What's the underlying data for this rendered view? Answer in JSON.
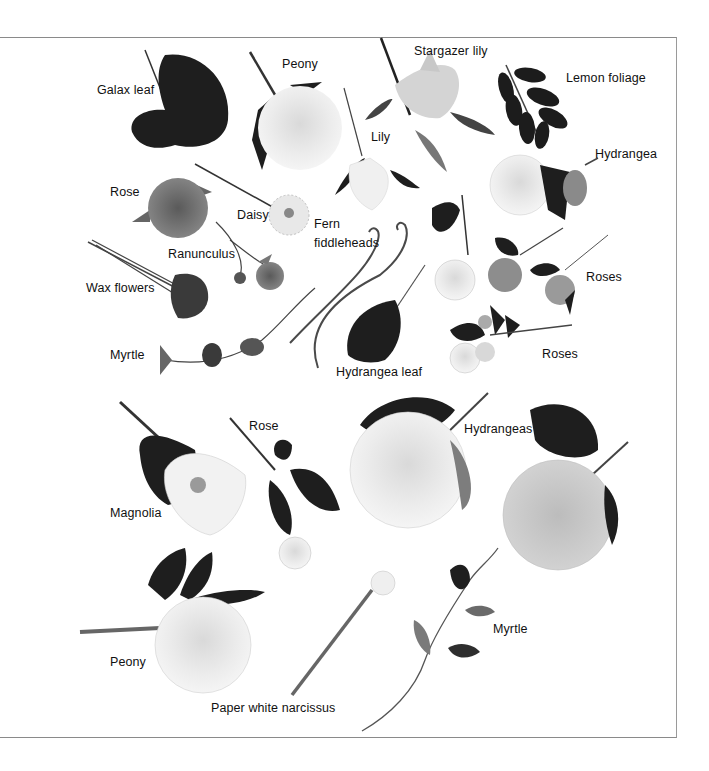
{
  "figure": {
    "title": "",
    "style": "grayscale botanical photo plate",
    "labels": [
      {
        "id": "galax-leaf",
        "text": "Galax leaf",
        "x": 97,
        "y": 81
      },
      {
        "id": "peony-top",
        "text": "Peony",
        "x": 282,
        "y": 55
      },
      {
        "id": "stargazer-lily",
        "text": "Stargazer lily",
        "x": 414,
        "y": 42
      },
      {
        "id": "lemon-foliage",
        "text": "Lemon foliage",
        "x": 566,
        "y": 69
      },
      {
        "id": "lily",
        "text": "Lily",
        "x": 371,
        "y": 128
      },
      {
        "id": "hydrangea",
        "text": "Hydrangea",
        "x": 595,
        "y": 145
      },
      {
        "id": "rose-top",
        "text": "Rose",
        "x": 110,
        "y": 183
      },
      {
        "id": "daisy",
        "text": "Daisy",
        "x": 237,
        "y": 206
      },
      {
        "id": "fern-fiddleheads-1",
        "text": "Fern",
        "x": 314,
        "y": 215
      },
      {
        "id": "fern-fiddleheads-2",
        "text": "fiddleheads",
        "x": 314,
        "y": 234
      },
      {
        "id": "ranunculus",
        "text": "Ranunculus",
        "x": 168,
        "y": 245
      },
      {
        "id": "wax-flowers",
        "text": "Wax flowers",
        "x": 86,
        "y": 279
      },
      {
        "id": "roses-right",
        "text": "Roses",
        "x": 586,
        "y": 268
      },
      {
        "id": "myrtle-top",
        "text": "Myrtle",
        "x": 110,
        "y": 346
      },
      {
        "id": "roses-bottom",
        "text": "Roses",
        "x": 542,
        "y": 345
      },
      {
        "id": "hydrangea-leaf",
        "text": "Hydrangea leaf",
        "x": 336,
        "y": 363
      },
      {
        "id": "rose-middle",
        "text": "Rose",
        "x": 249,
        "y": 417
      },
      {
        "id": "hydrangeas",
        "text": "Hydrangeas",
        "x": 464,
        "y": 420
      },
      {
        "id": "magnolia",
        "text": "Magnolia",
        "x": 110,
        "y": 504
      },
      {
        "id": "myrtle-bottom",
        "text": "Myrtle",
        "x": 493,
        "y": 620
      },
      {
        "id": "peony-bottom",
        "text": "Peony",
        "x": 110,
        "y": 653
      },
      {
        "id": "paper-white-narcissus",
        "text": "Paper white narcissus",
        "x": 211,
        "y": 699
      }
    ]
  },
  "colors": {
    "frame": "#8a8a8a",
    "label_text": "#111111",
    "dark_leaf": "#1c1c1c",
    "mid_gray": "#7a7a7a",
    "light_petal": "#e6e6e6"
  }
}
